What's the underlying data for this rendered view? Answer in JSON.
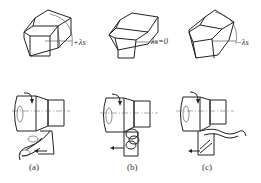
{
  "figure": {
    "panels": [
      {
        "id": "a",
        "caption": "(a)",
        "angle_label": "+λs",
        "angle_sign": "positive"
      },
      {
        "id": "b",
        "caption": "(b)",
        "angle_label": "λs=0",
        "angle_sign": "zero"
      },
      {
        "id": "c",
        "caption": "(c)",
        "angle_label": "−λs",
        "angle_sign": "negative"
      }
    ],
    "colors": {
      "line": "#222222",
      "background": "#ffffff"
    }
  }
}
